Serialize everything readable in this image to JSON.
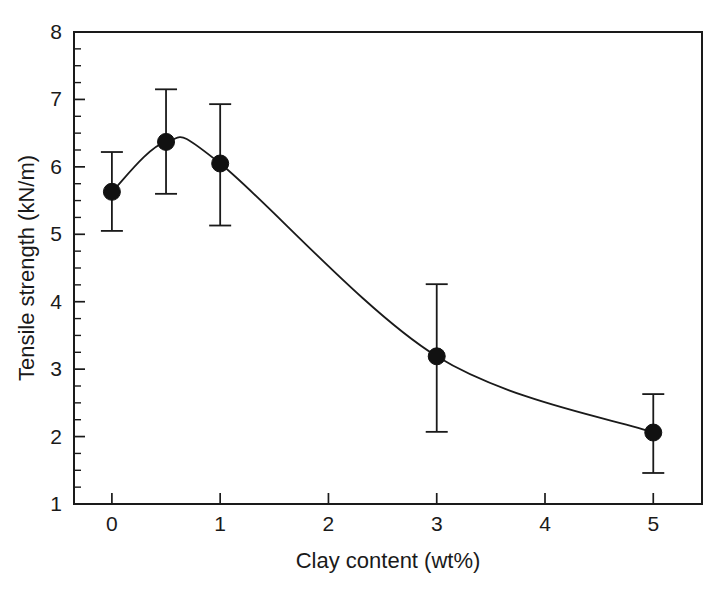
{
  "chart_data": {
    "type": "line",
    "title": "",
    "xlabel": "Clay content (wt%)",
    "ylabel": "Tensile strength (kN/m)",
    "xlim": [
      -0.35,
      5.45
    ],
    "ylim": [
      1,
      8
    ],
    "xticks": [
      0,
      1,
      2,
      3,
      4,
      5
    ],
    "xtick_labels": [
      "0",
      "1",
      "2",
      "3",
      "4",
      "5"
    ],
    "yticks": [
      1,
      2,
      3,
      4,
      5,
      6,
      7,
      8
    ],
    "ytick_labels": [
      "1",
      "2",
      "3",
      "4",
      "5",
      "6",
      "7",
      "8"
    ],
    "y_minor_tick_step": 0.25,
    "grid": false,
    "legend": "none",
    "marker": "filled-circle",
    "error_bars": "symmetric-vertical-with-caps",
    "x": [
      0,
      0.5,
      1,
      3,
      5
    ],
    "y": [
      5.63,
      6.37,
      6.05,
      3.19,
      2.06
    ],
    "yerr_upper": [
      6.22,
      7.15,
      6.93,
      4.26,
      2.63
    ],
    "yerr_lower": [
      5.05,
      5.6,
      5.13,
      2.07,
      1.46
    ],
    "series": [
      {
        "name": "Tensile strength",
        "points": [
          {
            "x": 0,
            "y": 5.63,
            "err_hi": 6.22,
            "err_lo": 5.05
          },
          {
            "x": 0.5,
            "y": 6.37,
            "err_hi": 7.15,
            "err_lo": 5.6
          },
          {
            "x": 1,
            "y": 6.05,
            "err_hi": 6.93,
            "err_lo": 5.13
          },
          {
            "x": 3,
            "y": 3.19,
            "err_hi": 4.26,
            "err_lo": 2.07
          },
          {
            "x": 5,
            "y": 2.06,
            "err_hi": 2.63,
            "err_lo": 1.46
          }
        ]
      }
    ],
    "colors": {
      "axis": "#1a1a1a",
      "curve": "#1a1a1a",
      "marker": "#111111",
      "background": "#ffffff"
    }
  }
}
